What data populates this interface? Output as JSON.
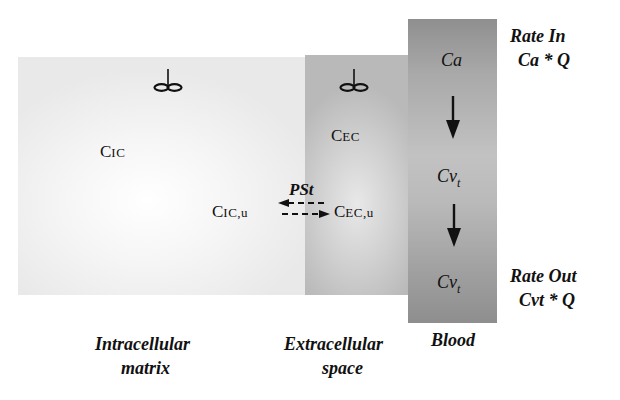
{
  "diagram": {
    "type": "physiological compartment model",
    "compartments": [
      {
        "id": "intracellular",
        "concentration_main": "C",
        "concentration_sub": "IC",
        "unbound_main": "C",
        "unbound_sub": "IC,u",
        "label_line1": "Intracellular",
        "label_line2": "matrix",
        "mixing": "stirrer"
      },
      {
        "id": "extracellular",
        "concentration_main": "C",
        "concentration_sub": "EC",
        "unbound_main": "C",
        "unbound_sub": "EC,u",
        "label_line1": "Extracellular",
        "label_line2": "space",
        "mixing": "stirrer"
      },
      {
        "id": "blood",
        "label_line1": "Blood",
        "arterial": "Ca",
        "venous_main": "Cv",
        "venous_sub": "t"
      }
    ],
    "exchange": {
      "label": "PSt",
      "direction": "bidirectional",
      "style": "dashed"
    },
    "rate_in": {
      "title": "Rate In",
      "formula": "Ca * Q"
    },
    "rate_out": {
      "title": "Rate Out",
      "formula": "Cvt * Q"
    },
    "colors": {
      "intracellular": "#efefef",
      "extracellular": "#c4c4c4",
      "blood": "#a6a6a6",
      "text": "#111111"
    }
  }
}
